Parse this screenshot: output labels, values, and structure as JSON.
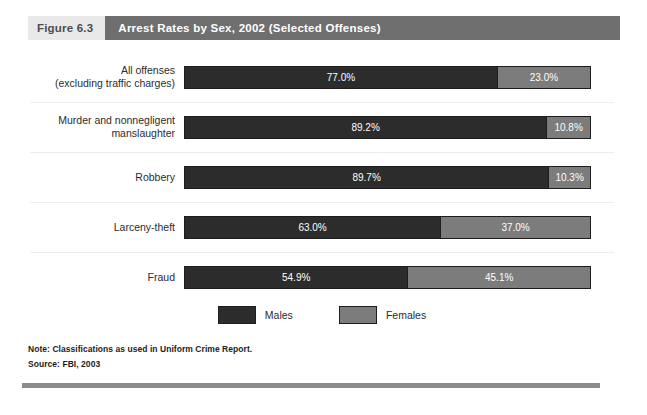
{
  "figure": {
    "number_label": "Figure 6.3",
    "title": "Arrest Rates by Sex, 2002 (Selected Offenses)"
  },
  "legend": {
    "items": [
      {
        "label": "Males",
        "color": "#2c2c2c",
        "swatch_name": "legend-swatch-males"
      },
      {
        "label": "Females",
        "color": "#7c7c7c",
        "swatch_name": "legend-swatch-females"
      }
    ]
  },
  "footer": {
    "note": "Note: Classifications as used in Uniform Crime Report.",
    "source": "Source: FBI, 2003"
  },
  "chart_data": {
    "type": "bar",
    "orientation": "horizontal",
    "stacked": true,
    "normalized_percent": true,
    "title": "Arrest Rates by Sex, 2002 (Selected Offenses)",
    "xlabel": "",
    "ylabel": "",
    "xlim": [
      0,
      100
    ],
    "grid": false,
    "legend_position": "bottom-center",
    "categories": [
      "All offenses\n(excluding traffic charges)",
      "Murder and nonnegligent\nmanslaughter",
      "Robbery",
      "Larceny-theft",
      "Fraud"
    ],
    "series": [
      {
        "name": "Males",
        "color": "#2c2c2c",
        "values": [
          77.0,
          89.2,
          89.7,
          63.0,
          54.9
        ]
      },
      {
        "name": "Females",
        "color": "#7c7c7c",
        "values": [
          23.0,
          10.8,
          10.3,
          37.0,
          45.1
        ]
      }
    ],
    "rows": [
      {
        "category": "All offenses\n(excluding traffic charges)",
        "males": 77.0,
        "females": 23.0,
        "males_label": "77.0%",
        "females_label": "23.0%"
      },
      {
        "category": "Murder and nonnegligent\nmanslaughter",
        "males": 89.2,
        "females": 10.8,
        "males_label": "89.2%",
        "females_label": "10.8%"
      },
      {
        "category": "Robbery",
        "males": 89.7,
        "females": 10.3,
        "males_label": "89.7%",
        "females_label": "10.3%"
      },
      {
        "category": "Larceny-theft",
        "males": 63.0,
        "females": 37.0,
        "males_label": "63.0%",
        "females_label": "37.0%"
      },
      {
        "category": "Fraud",
        "males": 54.9,
        "females": 45.1,
        "males_label": "54.9%",
        "females_label": "45.1%"
      }
    ]
  }
}
